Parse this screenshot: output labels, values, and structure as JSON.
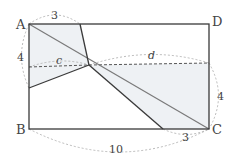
{
  "diagram": {
    "vertices": {
      "A": "A",
      "B": "B",
      "C": "C",
      "D": "D"
    },
    "measurements": {
      "top_segment": "3",
      "left_segment": "4",
      "right_segment": "4",
      "bottom_segment": "3",
      "bottom_total": "10",
      "left_variable": "c",
      "right_variable": "d"
    },
    "colors": {
      "line": "#3a3a3a",
      "diagonal": "#7a7a7a",
      "dashed": "#555555",
      "arc": "#aaaaaa",
      "shade": "#eef1f4"
    }
  }
}
